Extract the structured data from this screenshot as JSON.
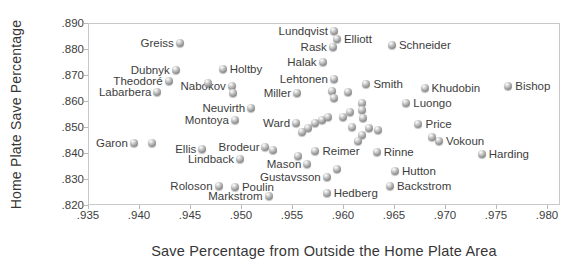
{
  "chart_data": {
    "type": "scatter",
    "title": "",
    "xlabel": "Save Percentage from Outside the Home Plate Area",
    "ylabel": "Home Plate Save Percentage",
    "xlim": [
      0.935,
      0.98
    ],
    "ylim": [
      0.82,
      0.89
    ],
    "grid": false,
    "legend": "none",
    "marker_color": "#8a8a8a",
    "axis_color": "#c9c9c9",
    "text_color": "#3d3d3d",
    "x_ticks": [
      {
        "v": 0.935,
        "label": ".935"
      },
      {
        "v": 0.94,
        "label": ".940"
      },
      {
        "v": 0.945,
        "label": ".945"
      },
      {
        "v": 0.95,
        "label": ".950"
      },
      {
        "v": 0.955,
        "label": ".955"
      },
      {
        "v": 0.96,
        "label": ".960"
      },
      {
        "v": 0.965,
        "label": ".965"
      },
      {
        "v": 0.97,
        "label": ".970"
      },
      {
        "v": 0.975,
        "label": ".975"
      },
      {
        "v": 0.98,
        "label": ".980"
      }
    ],
    "y_ticks": [
      {
        "v": 0.82,
        "label": ".820"
      },
      {
        "v": 0.83,
        "label": ".830"
      },
      {
        "v": 0.84,
        "label": ".840"
      },
      {
        "v": 0.85,
        "label": ".850"
      },
      {
        "v": 0.86,
        "label": ".860"
      },
      {
        "v": 0.87,
        "label": ".870"
      },
      {
        "v": 0.88,
        "label": ".880"
      },
      {
        "v": 0.89,
        "label": ".890"
      }
    ],
    "points": [
      {
        "name": "Greiss",
        "x": 0.944,
        "y": 0.8823,
        "side": "left"
      },
      {
        "name": "Lundqvist",
        "x": 0.9591,
        "y": 0.8869,
        "side": "left"
      },
      {
        "name": "Elliott",
        "x": 0.9594,
        "y": 0.8838,
        "side": "right"
      },
      {
        "name": "Rask",
        "x": 0.959,
        "y": 0.8808,
        "side": "left"
      },
      {
        "name": "Schneider",
        "x": 0.9648,
        "y": 0.8815,
        "side": "right"
      },
      {
        "name": "Dubnyk",
        "x": 0.9436,
        "y": 0.8719,
        "side": "left"
      },
      {
        "name": "Theodoré",
        "x": 0.9429,
        "y": 0.8677,
        "side": "left"
      },
      {
        "name": "Labarbera",
        "x": 0.9418,
        "y": 0.8635,
        "side": "left"
      },
      {
        "name": "Holtby",
        "x": 0.9482,
        "y": 0.8723,
        "side": "right"
      },
      {
        "name": "Halak",
        "x": 0.958,
        "y": 0.875,
        "side": "left"
      },
      {
        "name": "Lehtonen",
        "x": 0.9591,
        "y": 0.8685,
        "side": "left"
      },
      {
        "name": "Nabokov",
        "x": 0.9491,
        "y": 0.8658,
        "side": "left"
      },
      {
        "name": "Miller",
        "x": 0.9555,
        "y": 0.8631,
        "side": "left"
      },
      {
        "name": "Smith",
        "x": 0.9623,
        "y": 0.8665,
        "side": "right"
      },
      {
        "name": "Khudobin",
        "x": 0.968,
        "y": 0.865,
        "side": "right"
      },
      {
        "name": "Bishop",
        "x": 0.9762,
        "y": 0.8658,
        "side": "right"
      },
      {
        "name": "Luongo",
        "x": 0.9662,
        "y": 0.8592,
        "side": "right"
      },
      {
        "name": "Price",
        "x": 0.9674,
        "y": 0.8512,
        "side": "right"
      },
      {
        "name": "Neuvirth",
        "x": 0.951,
        "y": 0.8573,
        "side": "left"
      },
      {
        "name": "Montoya",
        "x": 0.9494,
        "y": 0.8527,
        "side": "left"
      },
      {
        "name": "Ward",
        "x": 0.9554,
        "y": 0.8515,
        "side": "left"
      },
      {
        "name": "Garon",
        "x": 0.9395,
        "y": 0.8438,
        "side": "left"
      },
      {
        "name": "Ellis",
        "x": 0.9462,
        "y": 0.8415,
        "side": "left"
      },
      {
        "name": "Brodeur",
        "x": 0.9524,
        "y": 0.8423,
        "side": "left"
      },
      {
        "name": "Lindback",
        "x": 0.9499,
        "y": 0.8377,
        "side": "left"
      },
      {
        "name": "Mason",
        "x": 0.9565,
        "y": 0.8358,
        "side": "left"
      },
      {
        "name": "Gustavsson",
        "x": 0.9584,
        "y": 0.8308,
        "side": "left"
      },
      {
        "name": "Roloson",
        "x": 0.9478,
        "y": 0.8273,
        "side": "left"
      },
      {
        "name": "Poulin",
        "x": 0.9494,
        "y": 0.8269,
        "side": "right"
      },
      {
        "name": "Markstrom",
        "x": 0.9527,
        "y": 0.8235,
        "side": "left"
      },
      {
        "name": "Reimer",
        "x": 0.9573,
        "y": 0.8408,
        "side": "right"
      },
      {
        "name": "Rinne",
        "x": 0.9633,
        "y": 0.8404,
        "side": "right"
      },
      {
        "name": "Hutton",
        "x": 0.9651,
        "y": 0.8331,
        "side": "right"
      },
      {
        "name": "Hedberg",
        "x": 0.9584,
        "y": 0.8246,
        "side": "right"
      },
      {
        "name": "Backstrom",
        "x": 0.9646,
        "y": 0.8273,
        "side": "right"
      },
      {
        "name": "Vokoun",
        "x": 0.9694,
        "y": 0.8446,
        "side": "right"
      },
      {
        "name": "Harding",
        "x": 0.9736,
        "y": 0.8396,
        "side": "right"
      },
      {
        "name": "",
        "x": 0.9413,
        "y": 0.8438,
        "side": null
      },
      {
        "name": "",
        "x": 0.9531,
        "y": 0.8412,
        "side": null
      },
      {
        "name": "",
        "x": 0.9468,
        "y": 0.8669,
        "side": null
      },
      {
        "name": "",
        "x": 0.9492,
        "y": 0.8631,
        "side": null
      },
      {
        "name": "",
        "x": 0.9687,
        "y": 0.8462,
        "side": null
      },
      {
        "name": "",
        "x": 0.9589,
        "y": 0.8638,
        "side": null
      },
      {
        "name": "",
        "x": 0.9591,
        "y": 0.8612,
        "side": null
      },
      {
        "name": "",
        "x": 0.9605,
        "y": 0.8635,
        "side": null
      },
      {
        "name": "",
        "x": 0.9619,
        "y": 0.8592,
        "side": null
      },
      {
        "name": "",
        "x": 0.9607,
        "y": 0.8558,
        "side": null
      },
      {
        "name": "",
        "x": 0.9619,
        "y": 0.8565,
        "side": null
      },
      {
        "name": "",
        "x": 0.96,
        "y": 0.8538,
        "side": null
      },
      {
        "name": "",
        "x": 0.962,
        "y": 0.8535,
        "side": null
      },
      {
        "name": "",
        "x": 0.9579,
        "y": 0.8527,
        "side": null
      },
      {
        "name": "",
        "x": 0.9585,
        "y": 0.8538,
        "side": null
      },
      {
        "name": "",
        "x": 0.9573,
        "y": 0.8515,
        "side": null
      },
      {
        "name": "",
        "x": 0.9566,
        "y": 0.8496,
        "side": null
      },
      {
        "name": "",
        "x": 0.956,
        "y": 0.8481,
        "side": null
      },
      {
        "name": "",
        "x": 0.9609,
        "y": 0.85,
        "side": null
      },
      {
        "name": "",
        "x": 0.9619,
        "y": 0.8469,
        "side": null
      },
      {
        "name": "",
        "x": 0.9625,
        "y": 0.8496,
        "side": null
      },
      {
        "name": "",
        "x": 0.9634,
        "y": 0.8488,
        "side": null
      },
      {
        "name": "",
        "x": 0.9615,
        "y": 0.8446,
        "side": null
      },
      {
        "name": "",
        "x": 0.9556,
        "y": 0.8388,
        "side": null
      },
      {
        "name": "",
        "x": 0.9594,
        "y": 0.8338,
        "side": null
      }
    ]
  }
}
